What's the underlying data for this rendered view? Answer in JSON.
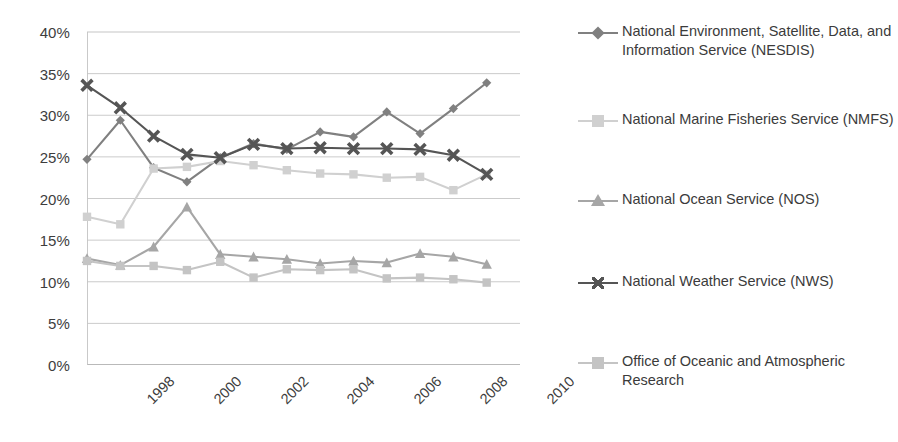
{
  "chart_data": {
    "type": "line",
    "title": "",
    "xlabel": "",
    "ylabel": "",
    "x": [
      1997,
      1998,
      1999,
      2000,
      2001,
      2002,
      2003,
      2004,
      2005,
      2006,
      2007,
      2008,
      2009
    ],
    "xtick_labels": [
      "1998",
      "2000",
      "2002",
      "2004",
      "2006",
      "2008",
      "2010"
    ],
    "xtick_values": [
      1998,
      2000,
      2002,
      2004,
      2006,
      2008,
      2010
    ],
    "ytick_labels": [
      "0%",
      "5%",
      "10%",
      "15%",
      "20%",
      "25%",
      "30%",
      "35%",
      "40%"
    ],
    "ytick_values": [
      0,
      5,
      10,
      15,
      20,
      25,
      30,
      35,
      40
    ],
    "ylim": [
      0,
      40
    ],
    "xlim": [
      1997,
      2010
    ],
    "grid": "horizontal",
    "legend_position": "right",
    "series": [
      {
        "name": "National Environment, Satellite, Data, and Information Service (NESDIS)",
        "short": "NESDIS",
        "marker": "diamond",
        "color": "#808080",
        "values": [
          24.7,
          29.4,
          23.7,
          22.0,
          24.9,
          26.6,
          25.9,
          28.0,
          27.4,
          30.4,
          27.8,
          30.8,
          33.9
        ]
      },
      {
        "name": "National Marine Fisheries Service (NMFS)",
        "short": "NMFS",
        "marker": "square",
        "color": "#d0d0d0",
        "values": [
          17.8,
          16.9,
          23.6,
          23.8,
          24.5,
          24.0,
          23.4,
          23.0,
          22.9,
          22.5,
          22.6,
          21.0,
          22.9
        ]
      },
      {
        "name": "National Ocean Service (NOS)",
        "short": "NOS",
        "marker": "triangle",
        "color": "#a6a6a6",
        "values": [
          12.8,
          12.0,
          14.2,
          19.0,
          13.3,
          13.0,
          12.7,
          12.2,
          12.5,
          12.3,
          13.4,
          13.0,
          12.1
        ]
      },
      {
        "name": "National Weather Service (NWS)",
        "short": "NWS",
        "marker": "x",
        "color": "#555555",
        "values": [
          33.6,
          30.9,
          27.5,
          25.3,
          24.9,
          26.5,
          26.0,
          26.1,
          26.0,
          26.0,
          25.9,
          25.2,
          22.9
        ]
      },
      {
        "name": "Office of Oceanic and Atmospheric Research",
        "short": "OAR",
        "marker": "square",
        "color": "#c4c4c4",
        "values": [
          12.5,
          11.9,
          11.9,
          11.4,
          12.4,
          10.5,
          11.5,
          11.4,
          11.5,
          10.4,
          10.5,
          10.3,
          9.9
        ]
      }
    ]
  },
  "legend": {
    "items": [
      {
        "label": "National Environment, Satellite, Data, and Information Service (NESDIS)"
      },
      {
        "label": "National Marine Fisheries Service (NMFS)"
      },
      {
        "label": "National Ocean Service (NOS)"
      },
      {
        "label": "National Weather Service (NWS)"
      },
      {
        "label": "Office of Oceanic and Atmospheric Research"
      }
    ]
  }
}
